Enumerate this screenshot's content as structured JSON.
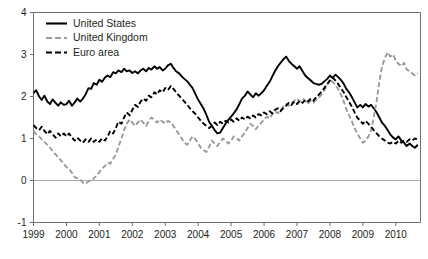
{
  "chart_data": {
    "type": "line",
    "title": "",
    "subtitle": "",
    "xlabel": "",
    "ylabel": "",
    "xlim": [
      1999.0,
      2010.75
    ],
    "ylim": [
      -1,
      4
    ],
    "grid": false,
    "zero_line": true,
    "legend_position": "top-left",
    "y_ticks": [
      "4",
      "3",
      "2",
      "1",
      "0",
      "-1"
    ],
    "y_tick_values": [
      4,
      3,
      2,
      1,
      0,
      -1
    ],
    "x_ticks": [
      "1999",
      "2000",
      "2001",
      "2002",
      "2003",
      "2004",
      "2005",
      "2006",
      "2007",
      "2008",
      "2009",
      "2010"
    ],
    "x_tick_values": [
      1999,
      2000,
      2001,
      2002,
      2003,
      2004,
      2005,
      2006,
      2007,
      2008,
      2009,
      2010
    ],
    "colors": {
      "united_states": "#000000",
      "united_kingdom": "#9a9a9a",
      "euro_area": "#000000",
      "axis": "#6d6e71",
      "zero_line": "#a7a9ac",
      "text": "#231f20",
      "background": "#ffffff"
    },
    "series": [
      {
        "name": "United States",
        "style": "solid",
        "color": "#000000",
        "x": [
          1999.0,
          1999.08,
          1999.17,
          1999.25,
          1999.33,
          1999.42,
          1999.5,
          1999.58,
          1999.67,
          1999.75,
          1999.83,
          1999.92,
          2000.0,
          2000.08,
          2000.17,
          2000.25,
          2000.33,
          2000.42,
          2000.5,
          2000.58,
          2000.67,
          2000.75,
          2000.83,
          2000.92,
          2001.0,
          2001.08,
          2001.17,
          2001.25,
          2001.33,
          2001.42,
          2001.5,
          2001.58,
          2001.67,
          2001.75,
          2001.83,
          2001.92,
          2002.0,
          2002.08,
          2002.17,
          2002.25,
          2002.33,
          2002.42,
          2002.5,
          2002.58,
          2002.67,
          2002.75,
          2002.83,
          2002.92,
          2003.0,
          2003.08,
          2003.17,
          2003.25,
          2003.33,
          2003.42,
          2003.5,
          2003.58,
          2003.67,
          2003.75,
          2003.83,
          2003.92,
          2004.0,
          2004.08,
          2004.17,
          2004.25,
          2004.33,
          2004.42,
          2004.5,
          2004.58,
          2004.67,
          2004.75,
          2004.83,
          2004.92,
          2005.0,
          2005.08,
          2005.17,
          2005.25,
          2005.33,
          2005.42,
          2005.5,
          2005.58,
          2005.67,
          2005.75,
          2005.83,
          2005.92,
          2006.0,
          2006.08,
          2006.17,
          2006.25,
          2006.33,
          2006.42,
          2006.5,
          2006.58,
          2006.67,
          2006.75,
          2006.83,
          2006.92,
          2007.0,
          2007.08,
          2007.17,
          2007.25,
          2007.33,
          2007.42,
          2007.5,
          2007.58,
          2007.67,
          2007.75,
          2007.83,
          2007.92,
          2008.0,
          2008.08,
          2008.17,
          2008.25,
          2008.33,
          2008.42,
          2008.5,
          2008.58,
          2008.67,
          2008.75,
          2008.83,
          2008.92,
          2009.0,
          2009.08,
          2009.17,
          2009.25,
          2009.33,
          2009.42,
          2009.5,
          2009.58,
          2009.67,
          2009.75,
          2009.83,
          2009.92,
          2010.0,
          2010.08,
          2010.17,
          2010.25,
          2010.33,
          2010.42,
          2010.5,
          2010.58,
          2010.67
        ],
        "values": [
          2.08,
          2.15,
          2.0,
          1.92,
          2.02,
          1.88,
          1.82,
          1.93,
          1.85,
          1.78,
          1.86,
          1.8,
          1.82,
          1.9,
          1.78,
          1.86,
          1.95,
          1.88,
          1.95,
          2.05,
          2.2,
          2.18,
          2.32,
          2.28,
          2.4,
          2.35,
          2.45,
          2.5,
          2.46,
          2.58,
          2.55,
          2.62,
          2.58,
          2.66,
          2.6,
          2.62,
          2.56,
          2.6,
          2.55,
          2.62,
          2.66,
          2.6,
          2.68,
          2.64,
          2.72,
          2.66,
          2.7,
          2.62,
          2.66,
          2.74,
          2.78,
          2.68,
          2.6,
          2.55,
          2.48,
          2.42,
          2.36,
          2.28,
          2.2,
          2.05,
          1.92,
          1.82,
          1.7,
          1.56,
          1.4,
          1.3,
          1.2,
          1.12,
          1.14,
          1.25,
          1.35,
          1.45,
          1.52,
          1.6,
          1.7,
          1.82,
          1.95,
          2.02,
          2.12,
          2.05,
          1.98,
          2.08,
          2.02,
          2.08,
          2.15,
          2.25,
          2.35,
          2.48,
          2.6,
          2.72,
          2.8,
          2.88,
          2.95,
          2.85,
          2.78,
          2.72,
          2.66,
          2.72,
          2.6,
          2.5,
          2.44,
          2.38,
          2.32,
          2.3,
          2.28,
          2.3,
          2.36,
          2.42,
          2.5,
          2.44,
          2.52,
          2.46,
          2.4,
          2.3,
          2.18,
          2.1,
          1.98,
          1.86,
          1.74,
          1.8,
          1.74,
          1.82,
          1.76,
          1.8,
          1.72,
          1.62,
          1.5,
          1.38,
          1.3,
          1.2,
          1.1,
          1.02,
          0.98,
          1.05,
          0.95,
          0.9,
          0.82,
          0.88,
          0.82,
          0.78,
          0.85
        ]
      },
      {
        "name": "United Kingdom",
        "style": "dashed",
        "color": "#9a9a9a",
        "x": [
          1999.0,
          1999.08,
          1999.17,
          1999.25,
          1999.33,
          1999.42,
          1999.5,
          1999.58,
          1999.67,
          1999.75,
          1999.83,
          1999.92,
          2000.0,
          2000.08,
          2000.17,
          2000.25,
          2000.33,
          2000.42,
          2000.5,
          2000.58,
          2000.67,
          2000.75,
          2000.83,
          2000.92,
          2001.0,
          2001.08,
          2001.17,
          2001.25,
          2001.33,
          2001.42,
          2001.5,
          2001.58,
          2001.67,
          2001.75,
          2001.83,
          2001.92,
          2002.0,
          2002.08,
          2002.17,
          2002.25,
          2002.33,
          2002.42,
          2002.5,
          2002.58,
          2002.67,
          2002.75,
          2002.83,
          2002.92,
          2003.0,
          2003.08,
          2003.17,
          2003.25,
          2003.33,
          2003.42,
          2003.5,
          2003.58,
          2003.67,
          2003.75,
          2003.83,
          2003.92,
          2004.0,
          2004.08,
          2004.17,
          2004.25,
          2004.33,
          2004.42,
          2004.5,
          2004.58,
          2004.67,
          2004.75,
          2004.83,
          2004.92,
          2005.0,
          2005.08,
          2005.17,
          2005.25,
          2005.33,
          2005.42,
          2005.5,
          2005.58,
          2005.67,
          2005.75,
          2005.83,
          2005.92,
          2006.0,
          2006.08,
          2006.17,
          2006.25,
          2006.33,
          2006.42,
          2006.5,
          2006.58,
          2006.67,
          2006.75,
          2006.83,
          2006.92,
          2007.0,
          2007.08,
          2007.17,
          2007.25,
          2007.33,
          2007.42,
          2007.5,
          2007.58,
          2007.67,
          2007.75,
          2007.83,
          2007.92,
          2008.0,
          2008.08,
          2008.17,
          2008.25,
          2008.33,
          2008.42,
          2008.5,
          2008.58,
          2008.67,
          2008.75,
          2008.83,
          2008.92,
          2009.0,
          2009.08,
          2009.17,
          2009.25,
          2009.33,
          2009.42,
          2009.5,
          2009.58,
          2009.67,
          2009.75,
          2009.83,
          2009.92,
          2010.0,
          2010.08,
          2010.17,
          2010.25,
          2010.33,
          2010.42,
          2010.5,
          2010.58,
          2010.67
        ],
        "values": [
          1.18,
          1.1,
          1.05,
          0.98,
          0.92,
          0.85,
          0.78,
          0.7,
          0.62,
          0.55,
          0.48,
          0.4,
          0.32,
          0.28,
          0.18,
          0.08,
          0.05,
          0.02,
          -0.05,
          -0.08,
          -0.02,
          0.0,
          0.05,
          0.12,
          0.2,
          0.28,
          0.35,
          0.42,
          0.4,
          0.52,
          0.62,
          0.8,
          1.0,
          1.2,
          1.35,
          1.45,
          1.38,
          1.3,
          1.38,
          1.45,
          1.38,
          1.3,
          1.42,
          1.5,
          1.45,
          1.38,
          1.45,
          1.4,
          1.35,
          1.42,
          1.38,
          1.3,
          1.2,
          1.1,
          1.0,
          0.9,
          0.85,
          0.95,
          1.05,
          0.98,
          0.88,
          0.78,
          0.72,
          0.68,
          0.8,
          0.95,
          0.88,
          0.82,
          0.92,
          1.0,
          0.95,
          0.88,
          0.95,
          1.05,
          1.0,
          0.95,
          1.05,
          1.15,
          1.25,
          1.35,
          1.3,
          1.22,
          1.3,
          1.38,
          1.45,
          1.52,
          1.48,
          1.58,
          1.65,
          1.6,
          1.68,
          1.75,
          1.82,
          1.78,
          1.85,
          1.9,
          1.95,
          1.88,
          1.95,
          1.9,
          1.82,
          1.9,
          1.85,
          1.92,
          1.98,
          2.05,
          2.15,
          2.28,
          2.4,
          2.35,
          2.28,
          2.18,
          2.05,
          1.88,
          1.7,
          1.55,
          1.4,
          1.25,
          1.12,
          1.0,
          0.9,
          0.95,
          1.05,
          1.2,
          1.5,
          1.9,
          2.35,
          2.7,
          2.92,
          3.05,
          2.95,
          3.0,
          2.85,
          2.78,
          2.72,
          2.8,
          2.65,
          2.6,
          2.55,
          2.5,
          2.55
        ]
      },
      {
        "name": "Euro area",
        "style": "dashed",
        "color": "#000000",
        "x": [
          1999.0,
          1999.08,
          1999.17,
          1999.25,
          1999.33,
          1999.42,
          1999.5,
          1999.58,
          1999.67,
          1999.75,
          1999.83,
          1999.92,
          2000.0,
          2000.08,
          2000.17,
          2000.25,
          2000.33,
          2000.42,
          2000.5,
          2000.58,
          2000.67,
          2000.75,
          2000.83,
          2000.92,
          2001.0,
          2001.08,
          2001.17,
          2001.25,
          2001.33,
          2001.42,
          2001.5,
          2001.58,
          2001.67,
          2001.75,
          2001.83,
          2001.92,
          2002.0,
          2002.08,
          2002.17,
          2002.25,
          2002.33,
          2002.42,
          2002.5,
          2002.58,
          2002.67,
          2002.75,
          2002.83,
          2002.92,
          2003.0,
          2003.08,
          2003.17,
          2003.25,
          2003.33,
          2003.42,
          2003.5,
          2003.58,
          2003.67,
          2003.75,
          2003.83,
          2003.92,
          2004.0,
          2004.08,
          2004.17,
          2004.25,
          2004.33,
          2004.42,
          2004.5,
          2004.58,
          2004.67,
          2004.75,
          2004.83,
          2004.92,
          2005.0,
          2005.08,
          2005.17,
          2005.25,
          2005.33,
          2005.42,
          2005.5,
          2005.58,
          2005.67,
          2005.75,
          2005.83,
          2005.92,
          2006.0,
          2006.08,
          2006.17,
          2006.25,
          2006.33,
          2006.42,
          2006.5,
          2006.58,
          2006.67,
          2006.75,
          2006.83,
          2006.92,
          2007.0,
          2007.08,
          2007.17,
          2007.25,
          2007.33,
          2007.42,
          2007.5,
          2007.58,
          2007.67,
          2007.75,
          2007.83,
          2007.92,
          2008.0,
          2008.08,
          2008.17,
          2008.25,
          2008.33,
          2008.42,
          2008.5,
          2008.58,
          2008.67,
          2008.75,
          2008.83,
          2008.92,
          2009.0,
          2009.08,
          2009.17,
          2009.25,
          2009.33,
          2009.42,
          2009.5,
          2009.58,
          2009.67,
          2009.75,
          2009.83,
          2009.92,
          2010.0,
          2010.08,
          2010.17,
          2010.25,
          2010.33,
          2010.42,
          2010.5,
          2010.58,
          2010.67
        ],
        "values": [
          1.32,
          1.25,
          1.2,
          1.28,
          1.18,
          1.1,
          1.18,
          1.1,
          1.02,
          1.12,
          1.05,
          1.12,
          1.05,
          1.12,
          1.02,
          0.95,
          1.02,
          0.95,
          0.9,
          0.98,
          0.92,
          1.0,
          0.92,
          0.98,
          0.92,
          1.0,
          0.95,
          1.05,
          1.18,
          1.12,
          1.25,
          1.4,
          1.35,
          1.5,
          1.62,
          1.55,
          1.68,
          1.8,
          1.75,
          1.88,
          1.95,
          1.9,
          2.02,
          1.98,
          2.1,
          2.05,
          2.15,
          2.1,
          2.2,
          2.15,
          2.25,
          2.18,
          2.1,
          2.02,
          1.95,
          1.88,
          1.8,
          1.72,
          1.65,
          1.58,
          1.5,
          1.42,
          1.35,
          1.3,
          1.25,
          1.3,
          1.38,
          1.32,
          1.4,
          1.35,
          1.42,
          1.38,
          1.45,
          1.4,
          1.48,
          1.42,
          1.5,
          1.45,
          1.52,
          1.48,
          1.55,
          1.5,
          1.58,
          1.55,
          1.62,
          1.58,
          1.65,
          1.6,
          1.68,
          1.72,
          1.65,
          1.72,
          1.78,
          1.85,
          1.8,
          1.88,
          1.82,
          1.9,
          1.85,
          1.92,
          1.88,
          1.95,
          1.9,
          1.98,
          2.05,
          2.12,
          2.2,
          2.3,
          2.38,
          2.45,
          2.38,
          2.3,
          2.2,
          2.1,
          1.98,
          1.88,
          1.75,
          1.62,
          1.5,
          1.42,
          1.35,
          1.42,
          1.35,
          1.28,
          1.2,
          1.12,
          1.05,
          1.0,
          0.95,
          0.9,
          0.88,
          0.92,
          0.88,
          0.95,
          0.9,
          0.95,
          0.92,
          0.98,
          0.95,
          1.0,
          0.98
        ]
      }
    ]
  },
  "legend": {
    "items": [
      {
        "label": "United States",
        "style": "solid",
        "color": "#000000"
      },
      {
        "label": "United Kingdom",
        "style": "dashed",
        "color": "#9a9a9a"
      },
      {
        "label": "Euro area",
        "style": "dashed",
        "color": "#000000"
      }
    ]
  }
}
